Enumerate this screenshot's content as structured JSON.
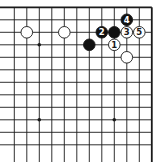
{
  "diagram": {
    "type": "go-board-corner",
    "colors": {
      "background": "#ffffff",
      "line": "#1a1a1a",
      "black": "#111111",
      "white": "#ffffff"
    },
    "grid": {
      "x0": 14.3,
      "y0": 7.3,
      "spacing": 12.5,
      "cols": 12,
      "rows": 12,
      "top_edge": true,
      "right_edge": true,
      "left_edge": false,
      "bottom_edge": false
    },
    "star_points": [
      {
        "col": 2,
        "row": 3
      },
      {
        "col": 2,
        "row": 9
      },
      {
        "col": 8,
        "row": 9
      }
    ],
    "stones": [
      {
        "color": "white",
        "col": 1,
        "row": 2,
        "label": ""
      },
      {
        "color": "white",
        "col": 4,
        "row": 2,
        "label": ""
      },
      {
        "color": "black",
        "col": 6,
        "row": 3,
        "label": ""
      },
      {
        "color": "black",
        "col": 7,
        "row": 2,
        "label": "2"
      },
      {
        "color": "black",
        "col": 8,
        "row": 2,
        "label": ""
      },
      {
        "color": "white",
        "col": 8,
        "row": 3,
        "label": "1"
      },
      {
        "color": "black",
        "col": 9,
        "row": 1,
        "label": "4"
      },
      {
        "color": "white",
        "col": 9,
        "row": 2,
        "label": "3"
      },
      {
        "color": "white",
        "col": 10,
        "row": 2,
        "label": "5"
      },
      {
        "color": "white",
        "col": 9,
        "row": 4,
        "label": ""
      }
    ]
  }
}
